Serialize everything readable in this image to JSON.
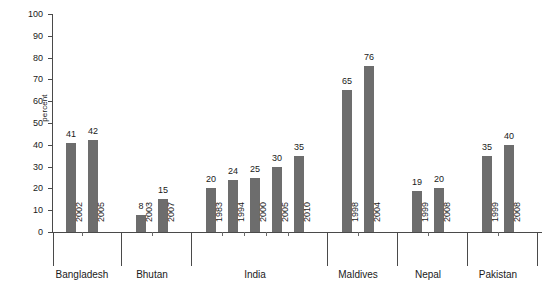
{
  "chart_data": {
    "type": "bar",
    "title": "",
    "xlabel": "",
    "ylabel": "percent",
    "ylim": [
      0,
      100
    ],
    "ytick_step": 10,
    "yticks": [
      0,
      10,
      20,
      30,
      40,
      50,
      60,
      70,
      80,
      90,
      100
    ],
    "grid": false,
    "legend": false,
    "bar_color": "#6d6d6d",
    "axis_color": "#4a4a4a",
    "categories": [
      "2002",
      "2005",
      "2003",
      "2007",
      "1983",
      "1994",
      "2000",
      "2005",
      "2010",
      "1998",
      "2004",
      "1999",
      "2008",
      "1999",
      "2008"
    ],
    "values": [
      41,
      42,
      8,
      15,
      20,
      24,
      25,
      30,
      35,
      65,
      76,
      19,
      20,
      35,
      40
    ],
    "groups": [
      {
        "label": "Bangladesh",
        "points": [
          {
            "x": "2002",
            "y": 41
          },
          {
            "x": "2005",
            "y": 42
          }
        ]
      },
      {
        "label": "Bhutan",
        "points": [
          {
            "x": "2003",
            "y": 8
          },
          {
            "x": "2007",
            "y": 15
          }
        ]
      },
      {
        "label": "India",
        "points": [
          {
            "x": "1983",
            "y": 20
          },
          {
            "x": "1994",
            "y": 24
          },
          {
            "x": "2000",
            "y": 25
          },
          {
            "x": "2005",
            "y": 30
          },
          {
            "x": "2010",
            "y": 35
          }
        ]
      },
      {
        "label": "Maldives",
        "points": [
          {
            "x": "1998",
            "y": 65
          },
          {
            "x": "2004",
            "y": 76
          }
        ]
      },
      {
        "label": "Nepal",
        "points": [
          {
            "x": "1999",
            "y": 19
          },
          {
            "x": "2008",
            "y": 20
          }
        ]
      },
      {
        "label": "Pakistan",
        "points": [
          {
            "x": "1999",
            "y": 35
          },
          {
            "x": "2008",
            "y": 40
          }
        ]
      }
    ]
  }
}
